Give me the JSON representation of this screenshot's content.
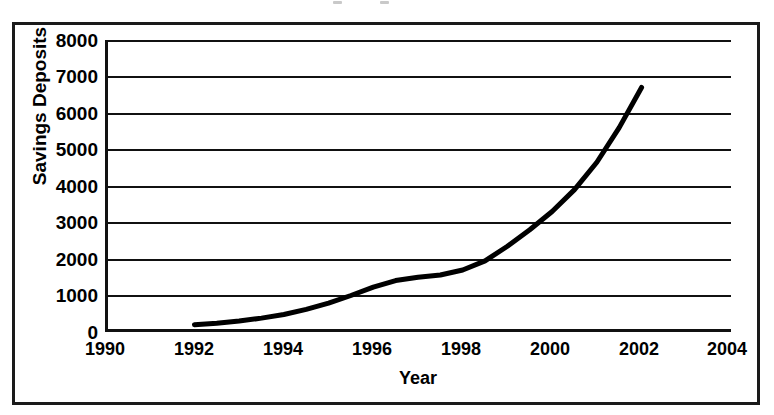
{
  "chart_data": {
    "type": "line",
    "title": "",
    "xlabel": "Year",
    "ylabel": "Savings Deposits",
    "xlim": [
      1990,
      2004
    ],
    "ylim": [
      0,
      8000
    ],
    "xticks": [
      1990,
      1992,
      1994,
      1996,
      1998,
      2000,
      2002,
      2004
    ],
    "xtick_labels": [
      "1990",
      "1992",
      "1994",
      "1996",
      "1998",
      "2000",
      "2002",
      "2004"
    ],
    "yticks": [
      0,
      1000,
      2000,
      3000,
      4000,
      5000,
      6000,
      7000,
      8000
    ],
    "ytick_labels": [
      "0",
      "1000",
      "2000",
      "3000",
      "4000",
      "5000",
      "6000",
      "7000",
      "8000"
    ],
    "grid": "horizontal",
    "legend": "none",
    "series": [
      {
        "name": "Savings Deposits",
        "color": "#000000",
        "line_width": 5,
        "x": [
          1992.0,
          1992.5,
          1993.0,
          1993.5,
          1994.0,
          1994.5,
          1995.0,
          1995.5,
          1996.0,
          1996.5,
          1997.0,
          1997.5,
          1998.0,
          1998.5,
          1999.0,
          1999.5,
          2000.0,
          2000.5,
          2001.0,
          2001.5,
          2002.0
        ],
        "values": [
          200,
          240,
          300,
          380,
          480,
          620,
          790,
          1000,
          1230,
          1410,
          1500,
          1560,
          1700,
          1950,
          2350,
          2800,
          3300,
          3900,
          4650,
          5600,
          6700
        ]
      }
    ],
    "annotations": []
  },
  "figure": {
    "y_axis_title": "Savings Deposits",
    "x_axis_title": "Year",
    "frame_color": "#1a1a1a",
    "grid_color": "#111111",
    "line_color": "#000000",
    "background": "#ffffff"
  }
}
